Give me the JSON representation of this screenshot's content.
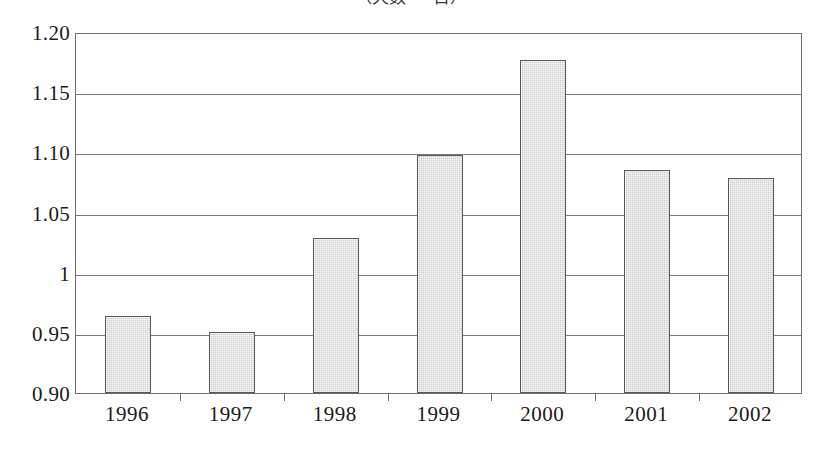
{
  "chart_data": {
    "type": "bar",
    "title": "（天数 ・ 日）",
    "title_note": "title is clipped at the top edge of the image; only the lower sliver of the glyphs is visible",
    "categories": [
      "1996",
      "1997",
      "1998",
      "1999",
      "2000",
      "2001",
      "2002"
    ],
    "values": [
      0.964,
      0.951,
      1.029,
      1.098,
      1.177,
      1.085,
      1.079
    ],
    "xlabel": "",
    "ylabel": "",
    "ylim": [
      0.9,
      1.2
    ],
    "ytick_step": 0.05,
    "ytick_labels": [
      "1.20",
      "1.15",
      "1.10",
      "1.05",
      "1",
      "0.95",
      "0.90"
    ],
    "ytick_values": [
      1.2,
      1.15,
      1.1,
      1.05,
      1.0,
      0.95,
      0.9
    ],
    "grid": true,
    "grid_axis": "y",
    "legend": null,
    "legend_position": "none",
    "bar_fill_color": "#cdcdcd",
    "bar_border_color": "#5a5a5a",
    "frame_color": "#6e6e6e",
    "background_color": "#ffffff"
  }
}
